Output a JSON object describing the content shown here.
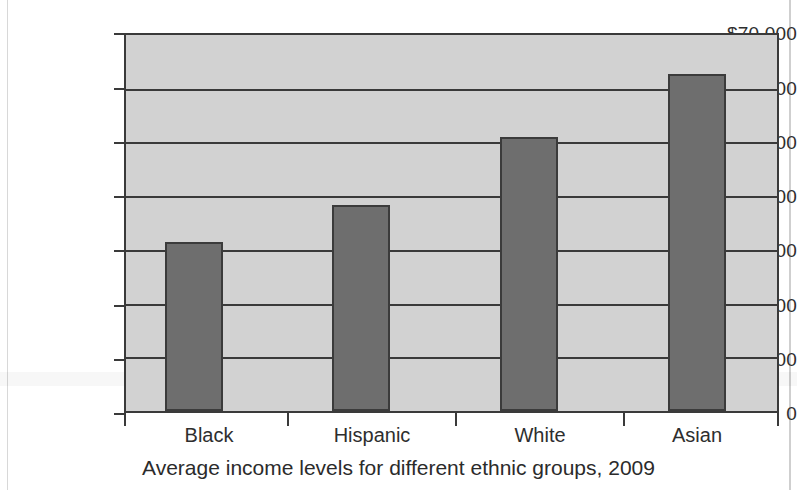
{
  "chart_data": {
    "type": "bar",
    "title": "",
    "caption": "Average income levels for different ethnic groups, 2009",
    "xlabel": "",
    "ylabel": "",
    "categories": [
      "Black",
      "Hispanic",
      "White",
      "Asian"
    ],
    "values": [
      31500,
      38300,
      51000,
      62800
    ],
    "ylim": [
      0,
      70000
    ],
    "ytick_values": [
      70000,
      60000,
      50000,
      40000,
      30000,
      20000,
      10000,
      0
    ],
    "ytick_labels": [
      "$70 000",
      "$60 000",
      "$50 000",
      "$40 000",
      "$30 000",
      "$20 000",
      "$10 000",
      "0"
    ],
    "grid": true,
    "legend": null,
    "series": [
      {
        "name": "Average income",
        "values": [
          31500,
          38300,
          51000,
          62800
        ]
      }
    ],
    "colors": {
      "bar_fill": "#6e6e6e",
      "bar_stroke": "#3b3b3b",
      "plot_background": "#d2d2d2",
      "axis": "#3a3a3a",
      "text": "#2e2e2e",
      "page_background": "#ffffff"
    }
  }
}
